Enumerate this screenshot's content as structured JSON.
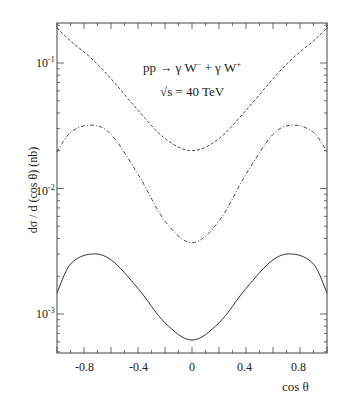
{
  "chart_data": {
    "type": "line",
    "title": "",
    "annotations": [
      "pp → γ W⁻ + γ W⁺",
      "√s = 40 TeV"
    ],
    "xlabel": "cos θ",
    "ylabel": "dσ / d (cos θ)   (nb)",
    "xlim": [
      -1,
      1
    ],
    "ylim": [
      0.00049,
      0.21
    ],
    "yscale": "log",
    "x_ticks": [
      "-0.8",
      "-0.4",
      "0",
      "0.4",
      "0.8"
    ],
    "y_ticks": [
      "10^-1",
      "10^-2",
      "10^-3"
    ],
    "grid": false,
    "x": [
      -1.0,
      -0.9,
      -0.75,
      -0.6,
      -0.4,
      -0.2,
      0.0,
      0.2,
      0.4,
      0.6,
      0.75,
      0.9,
      1.0
    ],
    "series": [
      {
        "name": "dashed (upper)",
        "style": "dashed",
        "values": [
          0.19,
          0.15,
          0.11,
          0.075,
          0.042,
          0.025,
          0.02,
          0.025,
          0.042,
          0.075,
          0.11,
          0.15,
          0.19
        ]
      },
      {
        "name": "dash-dot (middle)",
        "style": "dashdot",
        "values": [
          0.0195,
          0.028,
          0.032,
          0.027,
          0.013,
          0.0055,
          0.0037,
          0.0055,
          0.013,
          0.027,
          0.032,
          0.028,
          0.0195
        ]
      },
      {
        "name": "solid (lower)",
        "style": "solid",
        "values": [
          0.00147,
          0.0025,
          0.003,
          0.0027,
          0.0016,
          0.00085,
          0.00062,
          0.00085,
          0.0016,
          0.0027,
          0.003,
          0.0025,
          0.00147
        ]
      }
    ]
  },
  "labels": {
    "process": "pp  →  γ W",
    "process_sup1": "−",
    "process_mid": " +  γ W",
    "process_sup2": "+",
    "energy": "√s  =  40  TeV",
    "xlabel": "cos θ",
    "ylabel": "dσ / d (cos θ)    (nb)",
    "yt1": "10",
    "yt1e": "-1",
    "yt2": "10",
    "yt2e": "-2",
    "yt3": "10",
    "yt3e": "-3",
    "xt": [
      "-0.8",
      "-0.4",
      "0",
      "0.4",
      "0.8"
    ]
  }
}
